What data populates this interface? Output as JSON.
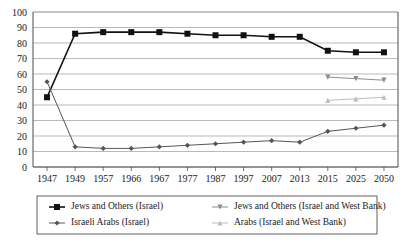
{
  "chart_data": {
    "type": "line",
    "title": "",
    "subtitle": "",
    "xlabel": "",
    "ylabel": "",
    "xlim": [
      0,
      12
    ],
    "ylim": [
      0,
      100
    ],
    "ytick_step": 10,
    "grid": true,
    "legend_position": "bottom",
    "categories": [
      "1947",
      "1949",
      "1957",
      "1966",
      "1967",
      "1977",
      "1987",
      "1997",
      "2007",
      "2013",
      "2015",
      "2025",
      "2050"
    ],
    "yticks": [
      "0",
      "10",
      "20",
      "30",
      "40",
      "50",
      "60",
      "70",
      "80",
      "90",
      "100"
    ],
    "series": [
      {
        "name": "Jews and Others (Israel)",
        "color": "#111111",
        "marker": "square",
        "values": [
          45,
          86,
          87,
          87,
          87,
          86,
          85,
          85,
          84,
          84,
          75,
          74,
          74
        ]
      },
      {
        "name": "Israeli Arabs (Israel)",
        "color": "#555555",
        "marker": "diamond",
        "values": [
          55,
          13,
          12,
          12,
          13,
          14,
          15,
          16,
          17,
          16,
          23,
          25,
          27
        ]
      },
      {
        "name": "Jews and Others (Israel and West Bank)",
        "color": "#8c8c8c",
        "marker": "triangle-down",
        "values": [
          null,
          null,
          null,
          null,
          null,
          null,
          null,
          null,
          null,
          null,
          58,
          57,
          56
        ]
      },
      {
        "name": "Arabs (Israel and West Bank)",
        "color": "#bdbdbd",
        "marker": "triangle-up",
        "values": [
          null,
          null,
          null,
          null,
          null,
          null,
          null,
          null,
          null,
          null,
          43,
          44,
          45
        ]
      }
    ]
  },
  "legend": {
    "items": [
      {
        "label": "Jews and Others (Israel)"
      },
      {
        "label": "Jews and Others (Israel and West Bank)"
      },
      {
        "label": "Israeli Arabs (Israel)"
      },
      {
        "label": "Arabs (Israel and West Bank)"
      }
    ]
  }
}
